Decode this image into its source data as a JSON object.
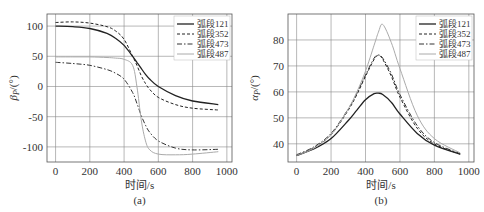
{
  "chart_data": [
    {
      "type": "line",
      "panel": "(a)",
      "title": "",
      "xlabel": "时间/s",
      "ylabel": "βP/(°)",
      "xlim": [
        -50,
        1030
      ],
      "ylim": [
        -125,
        120
      ],
      "xticks": [
        0,
        200,
        400,
        600,
        800,
        1000
      ],
      "yticks": [
        100,
        50,
        0,
        -50,
        -100
      ],
      "grid": true,
      "legend_position": "upper right",
      "x": [
        0,
        100,
        200,
        300,
        350,
        400,
        450,
        475,
        500,
        525,
        550,
        600,
        700,
        800,
        950
      ],
      "series": [
        {
          "name": "弧段121",
          "style": "solid",
          "color": "#222222",
          "width": 1.3,
          "values": [
            100,
            99,
            96,
            88,
            80,
            68,
            50,
            40,
            30,
            20,
            12,
            0,
            -15,
            -24,
            -30
          ]
        },
        {
          "name": "弧段352",
          "style": "dashed",
          "color": "#222222",
          "width": 1.0,
          "values": [
            106,
            107,
            105,
            99,
            92,
            78,
            50,
            35,
            18,
            5,
            -5,
            -18,
            -30,
            -36,
            -39
          ]
        },
        {
          "name": "弧段473",
          "style": "dashdot",
          "color": "#333333",
          "width": 1.0,
          "values": [
            40,
            38,
            35,
            28,
            22,
            12,
            -10,
            -28,
            -48,
            -64,
            -76,
            -90,
            -102,
            -105,
            -104
          ]
        },
        {
          "name": "弧段487",
          "style": "solid-light",
          "color": "#aaaaaa",
          "width": 1.0,
          "values": [
            49,
            49,
            49,
            48,
            47,
            45,
            35,
            0,
            -55,
            -90,
            -105,
            -112,
            -113,
            -112,
            -108
          ]
        }
      ]
    },
    {
      "type": "line",
      "panel": "(b)",
      "title": "",
      "xlabel": "时间/s",
      "ylabel": "αP/(°)",
      "xlim": [
        -50,
        1030
      ],
      "ylim": [
        33,
        90
      ],
      "xticks": [
        0,
        200,
        400,
        600,
        800,
        1000
      ],
      "yticks": [
        80,
        70,
        60,
        50,
        40
      ],
      "grid": true,
      "legend_position": "upper right",
      "x": [
        0,
        100,
        200,
        300,
        350,
        400,
        450,
        475,
        500,
        550,
        600,
        700,
        800,
        950
      ],
      "series": [
        {
          "name": "弧段121",
          "style": "solid",
          "color": "#222222",
          "width": 1.3,
          "values": [
            35.5,
            38,
            42,
            49,
            53,
            57,
            59.3,
            59.5,
            59,
            56,
            51.5,
            44,
            39.5,
            36
          ]
        },
        {
          "name": "弧段352",
          "style": "dashed",
          "color": "#222222",
          "width": 1.0,
          "values": [
            35.5,
            38.5,
            43.5,
            53,
            59,
            66,
            72.5,
            74,
            72.5,
            66,
            58,
            46,
            40,
            36
          ]
        },
        {
          "name": "弧段473",
          "style": "dashdot",
          "color": "#333333",
          "width": 1.0,
          "values": [
            35.8,
            38.8,
            44,
            53.5,
            59.5,
            66.5,
            73,
            74.2,
            73,
            67,
            59,
            47,
            40.5,
            36.2
          ]
        },
        {
          "name": "弧段487",
          "style": "solid-light",
          "color": "#aaaaaa",
          "width": 1.0,
          "values": [
            35.5,
            38.3,
            43.5,
            53.5,
            60,
            68,
            78,
            83,
            86,
            79,
            69,
            51,
            42,
            36.5
          ]
        }
      ]
    }
  ],
  "panels": [
    {
      "label": "(a)",
      "xlabel": "时间/s",
      "ylabel_main": "β",
      "ylabel_sub": "P",
      "ylabel_unit": "/(°)"
    },
    {
      "label": "(b)",
      "xlabel": "时间/s",
      "ylabel_main": "α",
      "ylabel_sub": "P",
      "ylabel_unit": "/(°)"
    }
  ],
  "legend": [
    "弧段121",
    "弧段352",
    "弧段473",
    "弧段487"
  ]
}
